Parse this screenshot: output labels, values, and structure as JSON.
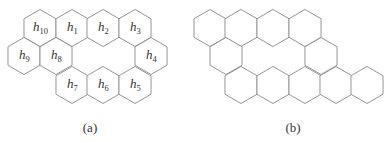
{
  "figure": {
    "stroke_color": "#8a8a8a",
    "text_color": "#333333",
    "hex_radius": 18.5,
    "panels": [
      {
        "id": "a",
        "caption": "(a)",
        "caption_pos": [
          90,
          128
        ],
        "hexagons": [
          {
            "cx": 40,
            "cy": 28,
            "label": "h",
            "sub": "10"
          },
          {
            "cx": 72,
            "cy": 28,
            "label": "h",
            "sub": "1"
          },
          {
            "cx": 103,
            "cy": 28,
            "label": "h",
            "sub": "2"
          },
          {
            "cx": 135,
            "cy": 28,
            "label": "h",
            "sub": "3"
          },
          {
            "cx": 24,
            "cy": 56,
            "label": "h",
            "sub": "9"
          },
          {
            "cx": 56,
            "cy": 56,
            "label": "h",
            "sub": "8"
          },
          {
            "cx": 151,
            "cy": 56,
            "label": "h",
            "sub": "4"
          },
          {
            "cx": 72,
            "cy": 85,
            "label": "h",
            "sub": "7"
          },
          {
            "cx": 103,
            "cy": 85,
            "label": "h",
            "sub": "6"
          },
          {
            "cx": 135,
            "cy": 85,
            "label": "h",
            "sub": "5"
          }
        ]
      },
      {
        "id": "b",
        "caption": "(b)",
        "caption_pos": [
          293,
          128
        ],
        "hexagons": [
          {
            "cx": 210,
            "cy": 28
          },
          {
            "cx": 241,
            "cy": 28
          },
          {
            "cx": 273,
            "cy": 28
          },
          {
            "cx": 305,
            "cy": 28
          },
          {
            "cx": 226,
            "cy": 56
          },
          {
            "cx": 321,
            "cy": 56
          },
          {
            "cx": 241,
            "cy": 85
          },
          {
            "cx": 273,
            "cy": 85
          },
          {
            "cx": 305,
            "cy": 85
          },
          {
            "cx": 336,
            "cy": 85
          },
          {
            "cx": 367,
            "cy": 85
          }
        ]
      }
    ]
  }
}
